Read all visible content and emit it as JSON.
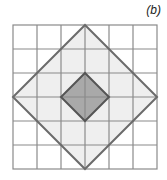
{
  "figure": {
    "label": "(b)",
    "grid": {
      "rows": 6,
      "cols": 6,
      "cell_size_px": 24,
      "origin_px": [
        13,
        25
      ]
    },
    "shapes": [
      {
        "name": "large-square-rotated",
        "vertices_grid": [
          [
            3,
            0
          ],
          [
            6,
            3
          ],
          [
            3,
            6
          ],
          [
            0,
            3
          ]
        ],
        "fill": "#efefef",
        "stroke": "#6b6b6b"
      },
      {
        "name": "small-square-rotated",
        "vertices_grid": [
          [
            3,
            2
          ],
          [
            4,
            3
          ],
          [
            3,
            4
          ],
          [
            2,
            3
          ]
        ],
        "fill": "#a9a9a9",
        "stroke": "#555555"
      }
    ],
    "colors": {
      "grid_line": "#8a8a8a",
      "background": "#ffffff"
    }
  }
}
